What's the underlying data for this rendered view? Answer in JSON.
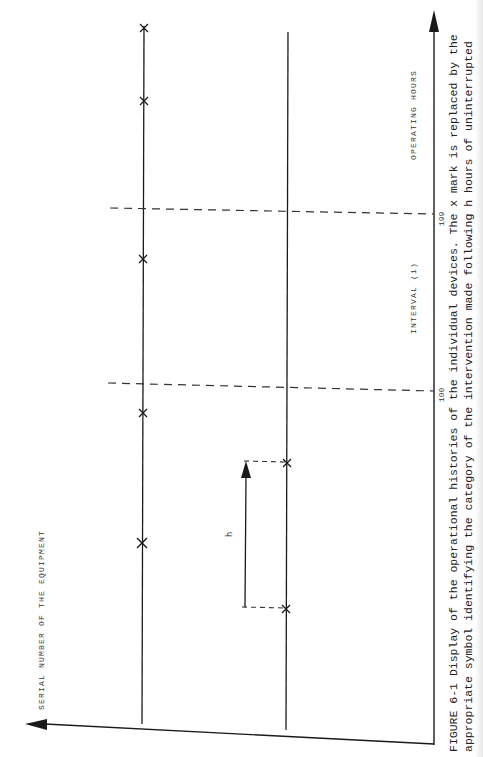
{
  "figure": {
    "caption_line1": "FIGURE 6-1  Display of the operational histories of the individual devices.  The x mark is replaced by the",
    "caption_line2": "appropriate symbol identifying the category of the intervention made following h hours of uninterrupted"
  },
  "axes": {
    "horizontal_axis_label": "OPERATING HOURS",
    "vertical_axis_label": "SERIAL NUMBER OF THE EQUIPMENT",
    "interval_label": "INTERVAL (i)",
    "tick_labels": [
      "100",
      "199"
    ]
  },
  "annotation": {
    "h_label": "h"
  },
  "timelines": [
    {
      "name": "device-line-1",
      "marks_at_y": [
        28,
        100,
        258,
        412,
        543
      ]
    },
    {
      "name": "device-line-2",
      "marks_at_y": [
        293,
        552
      ]
    }
  ],
  "colors": {
    "ink": "#1a1a1a",
    "dash": "#333333",
    "background": "#ffffff"
  }
}
